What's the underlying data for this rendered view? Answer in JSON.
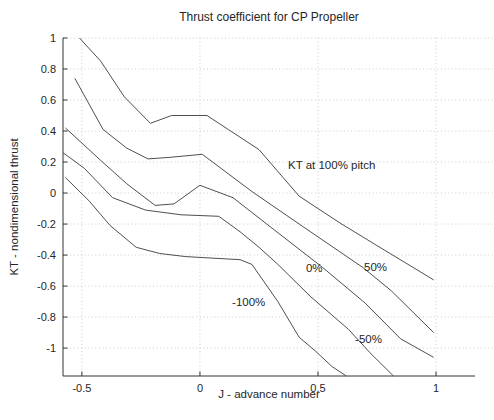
{
  "chart_data": {
    "type": "line",
    "title": "Thrust coefficient for CP Propeller",
    "xlabel": "J - advance number",
    "ylabel": "KT - nondimensional thrust",
    "xlim": [
      -0.58,
      1.165
    ],
    "ylim": [
      -1.18,
      1.0
    ],
    "xticks": [
      -0.5,
      0,
      0.5,
      1
    ],
    "xtick_labels": [
      "-0.5",
      "0",
      "0.5",
      "1"
    ],
    "yticks": [
      1,
      0.8,
      0.6,
      0.4,
      0.2,
      0,
      -0.2,
      -0.4,
      -0.6,
      -0.8,
      -1
    ],
    "ytick_labels": [
      "1",
      "0.8",
      "0.6",
      "0.4",
      "0.2",
      "0",
      "-0.2",
      "-0.4",
      "-0.6",
      "-0.8",
      "-1"
    ],
    "grid": true,
    "legend": "none",
    "line_color": "#4f4f4f",
    "grid_color": "#c7c7c7",
    "axis_color": "#333333",
    "text_color": "#262626",
    "series": [
      {
        "name": "KT at 100% pitch",
        "points": [
          [
            -0.51,
            1.0
          ],
          [
            -0.42,
            0.85
          ],
          [
            -0.32,
            0.62
          ],
          [
            -0.21,
            0.45
          ],
          [
            -0.12,
            0.5
          ],
          [
            0.03,
            0.5
          ],
          [
            0.12,
            0.41
          ],
          [
            0.25,
            0.28
          ],
          [
            0.42,
            -0.02
          ],
          [
            0.59,
            -0.19
          ],
          [
            0.74,
            -0.33
          ],
          [
            0.99,
            -0.56
          ]
        ]
      },
      {
        "name": "KT at 50% pitch",
        "points": [
          [
            -0.53,
            0.74
          ],
          [
            -0.41,
            0.41
          ],
          [
            -0.31,
            0.29
          ],
          [
            -0.22,
            0.22
          ],
          [
            -0.13,
            0.23
          ],
          [
            0.01,
            0.25
          ],
          [
            0.22,
            0.01
          ],
          [
            0.44,
            -0.22
          ],
          [
            0.69,
            -0.48
          ],
          [
            0.81,
            -0.63
          ],
          [
            0.99,
            -0.9
          ]
        ]
      },
      {
        "name": "KT at 0% pitch",
        "points": [
          [
            -0.57,
            0.42
          ],
          [
            -0.42,
            0.21
          ],
          [
            -0.31,
            0.06
          ],
          [
            -0.19,
            -0.08
          ],
          [
            -0.11,
            -0.07
          ],
          [
            0.0,
            0.05
          ],
          [
            0.14,
            -0.03
          ],
          [
            0.3,
            -0.22
          ],
          [
            0.52,
            -0.48
          ],
          [
            0.7,
            -0.71
          ],
          [
            0.85,
            -0.94
          ],
          [
            0.99,
            -1.06
          ]
        ]
      },
      {
        "name": "KT at -50% pitch",
        "points": [
          [
            -0.58,
            0.26
          ],
          [
            -0.49,
            0.16
          ],
          [
            -0.37,
            -0.03
          ],
          [
            -0.23,
            -0.11
          ],
          [
            -0.08,
            -0.14
          ],
          [
            0.08,
            -0.15
          ],
          [
            0.17,
            -0.25
          ],
          [
            0.25,
            -0.35
          ],
          [
            0.33,
            -0.46
          ],
          [
            0.47,
            -0.67
          ],
          [
            0.63,
            -0.88
          ],
          [
            0.72,
            -1.03
          ],
          [
            0.82,
            -1.18
          ]
        ]
      },
      {
        "name": "KT at -100% pitch",
        "points": [
          [
            -0.57,
            0.1
          ],
          [
            -0.47,
            -0.05
          ],
          [
            -0.38,
            -0.21
          ],
          [
            -0.27,
            -0.35
          ],
          [
            -0.17,
            -0.39
          ],
          [
            -0.06,
            -0.41
          ],
          [
            0.17,
            -0.43
          ],
          [
            0.22,
            -0.46
          ],
          [
            0.33,
            -0.7
          ],
          [
            0.42,
            -0.93
          ],
          [
            0.49,
            -1.02
          ],
          [
            0.56,
            -1.12
          ],
          [
            0.62,
            -1.18
          ]
        ]
      }
    ],
    "annotations": [
      {
        "text": "KT at 100% pitch",
        "x": 0.373,
        "y": 0.155
      },
      {
        "text": "0%",
        "x": 0.449,
        "y": -0.51
      },
      {
        "text": "50%",
        "x": 0.695,
        "y": -0.503
      },
      {
        "text": "-100%",
        "x": 0.136,
        "y": -0.729
      },
      {
        "text": "-50%",
        "x": 0.657,
        "y": -0.968
      }
    ]
  },
  "layout_note": ""
}
